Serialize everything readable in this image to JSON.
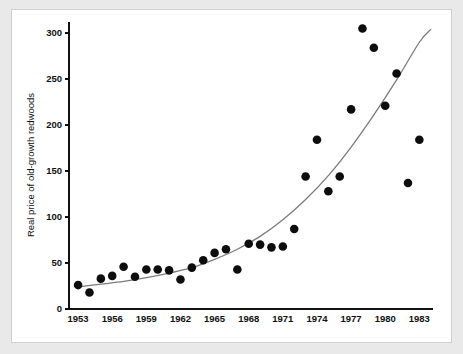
{
  "figure": {
    "background_color": "#e9e9e9",
    "panel_color": "#ffffff",
    "border_color": "#cfcfcf"
  },
  "chart_data": {
    "type": "scatter",
    "title": "",
    "subtitle": "",
    "xlabel": "",
    "ylabel": "Real price of old-growth redwoods",
    "xlim": [
      1952.2,
      1984.2
    ],
    "ylim": [
      0,
      312
    ],
    "xticks": [
      1953,
      1956,
      1959,
      1962,
      1965,
      1968,
      1971,
      1974,
      1977,
      1980,
      1983
    ],
    "xticklabels": [
      "1953",
      "1956",
      "1959",
      "1962",
      "1965",
      "1968",
      "1971",
      "1974",
      "1977",
      "1980",
      "1983"
    ],
    "yticks": [
      0,
      50,
      100,
      150,
      200,
      250,
      300
    ],
    "yticklabels": [
      "0",
      "50",
      "100",
      "150",
      "200",
      "250",
      "300"
    ],
    "grid": false,
    "legend": null,
    "legend_position": "none",
    "marker": "filled-circle",
    "marker_color": "#0d0d0d",
    "marker_size": 4.3,
    "series": [
      {
        "name": "Real price of old-growth redwoods",
        "type": "scatter",
        "x": [
          1953,
          1954,
          1955,
          1956,
          1957,
          1958,
          1959,
          1960,
          1961,
          1962,
          1963,
          1964,
          1965,
          1966,
          1967,
          1968,
          1969,
          1970,
          1971,
          1972,
          1973,
          1974,
          1975,
          1976,
          1977,
          1978,
          1979,
          1980,
          1981,
          1982,
          1983
        ],
        "y": [
          26,
          18,
          33,
          36,
          46,
          35,
          43,
          43,
          42,
          32,
          45,
          53,
          61,
          65,
          43,
          71,
          70,
          67,
          68,
          87,
          144,
          184,
          128,
          144,
          217,
          305,
          284,
          221,
          256,
          137,
          184
        ]
      },
      {
        "name": "fitted exponential trend",
        "type": "line",
        "color": "#7c7c7c",
        "x": [
          1953,
          1955,
          1957,
          1959,
          1961,
          1963,
          1965,
          1967,
          1969,
          1971,
          1973,
          1975,
          1977,
          1979,
          1981,
          1983,
          1984
        ],
        "y": [
          24,
          27,
          30,
          34,
          39,
          45,
          54,
          65,
          79,
          97,
          119,
          145,
          176,
          211,
          249,
          290,
          304
        ]
      }
    ]
  }
}
